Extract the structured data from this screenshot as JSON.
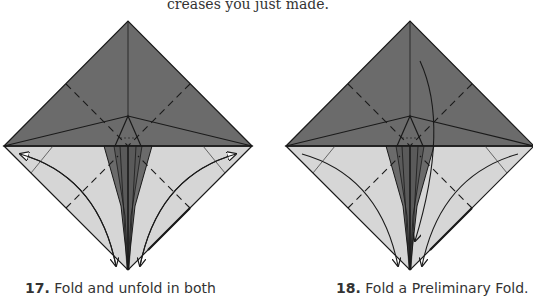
{
  "intro_text": "creases you just made.",
  "colors": {
    "paper_dark": "#6b6b6b",
    "paper_light": "#d6d6d6",
    "line": "#1a1a1a",
    "background": "#ffffff"
  },
  "steps": [
    {
      "number": "17.",
      "caption": "Fold and unfold in both",
      "diagram": "square-base-with-kite-folds",
      "arrows": [
        "fold-and-unfold-left",
        "fold-and-unfold-right"
      ]
    },
    {
      "number": "18.",
      "caption": "Fold a Preliminary Fold.",
      "diagram": "square-base-with-kite-folds",
      "arrows": [
        "fold-left-flap-down",
        "fold-right-flap-down",
        "fold-top-down"
      ]
    }
  ]
}
